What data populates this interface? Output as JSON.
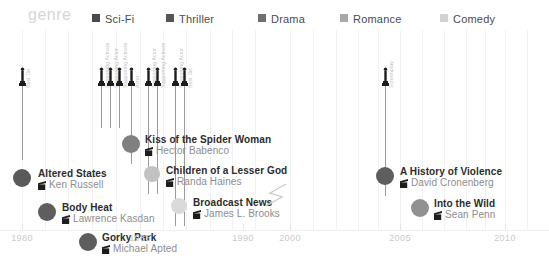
{
  "legend": {
    "title": "genre",
    "items": [
      {
        "label": "Sci-Fi",
        "color": "#4a4a4a",
        "x": 92
      },
      {
        "label": "Thriller",
        "color": "#555555",
        "x": 166
      },
      {
        "label": "Drama",
        "color": "#6e6e6e",
        "x": 258
      },
      {
        "label": "Romance",
        "color": "#a8a8a8",
        "x": 340
      },
      {
        "label": "Comedy",
        "color": "#d2d2d2",
        "x": 440
      }
    ]
  },
  "axis": {
    "ticks": [
      {
        "label": "1980",
        "x": 22
      },
      {
        "label": "1985",
        "x": 140
      },
      {
        "label": "1990",
        "x": 243
      },
      {
        "label": "2000",
        "x": 290
      },
      {
        "label": "2005",
        "x": 400
      },
      {
        "label": "2010",
        "x": 505
      }
    ],
    "break_marker": "axis-break-zigzag"
  },
  "nominations": [
    {
      "category": "Best Dir.",
      "x": 22,
      "top": 36,
      "stem_height": 74,
      "label_y": 58
    },
    {
      "category": "Supporting Actress",
      "x": 101,
      "top": 36,
      "stem_height": 42,
      "label_y": 58
    },
    {
      "category": "Supporting Actor",
      "x": 110,
      "top": 36,
      "stem_height": 42,
      "label_y": 58
    },
    {
      "category": "Supporting Actress",
      "x": 119,
      "top": 36,
      "stem_height": 42,
      "label_y": 58
    },
    {
      "category": "Actor",
      "x": 131,
      "top": 36,
      "stem_height": 78,
      "label_y": 58
    },
    {
      "category": "Supporting Actor",
      "x": 148,
      "top": 36,
      "stem_height": 108,
      "label_y": 58
    },
    {
      "category": "Supporting Actress",
      "x": 157,
      "top": 36,
      "stem_height": 108,
      "label_y": 58
    },
    {
      "category": "Supporting Actor",
      "x": 175,
      "top": 36,
      "stem_height": 140,
      "label_y": 58
    },
    {
      "category": "Best Dir.",
      "x": 184,
      "top": 36,
      "stem_height": 140,
      "label_y": 58
    },
    {
      "category": "Screenplay",
      "x": 385,
      "top": 36,
      "stem_height": 110,
      "label_y": 58
    }
  ],
  "films": [
    {
      "title": "Altered States",
      "director": "Ken Russell",
      "genre": "Sci-Fi",
      "color": "#5a5a5a",
      "dot_x": 22,
      "dot_y": 148,
      "dot_r": 9,
      "has_stem": true,
      "label_x": 38,
      "label_y": 138
    },
    {
      "title": "Body Heat",
      "director": "Lawrence Kasdan",
      "genre": "Thriller",
      "color": "#5e5e5e",
      "dot_x": 47,
      "dot_y": 182,
      "dot_r": 9,
      "has_stem": false,
      "label_x": 62,
      "label_y": 172
    },
    {
      "title": "Gorky Park",
      "director": "Michael Apted",
      "genre": "Thriller",
      "color": "#5e5e5e",
      "dot_x": 88,
      "dot_y": 212,
      "dot_r": 9,
      "has_stem": false,
      "label_x": 102,
      "label_y": 202
    },
    {
      "title": "Kiss of the Spider Woman",
      "director": "Hector Babenco",
      "genre": "Drama",
      "color": "#808080",
      "dot_x": 131,
      "dot_y": 114,
      "dot_r": 9,
      "has_stem": true,
      "label_x": 145,
      "label_y": 104
    },
    {
      "title": "Children of a Lesser God",
      "director": "Randa Haines",
      "genre": "Romance",
      "color": "#c2c2c2",
      "dot_x": 152,
      "dot_y": 144,
      "dot_r": 8,
      "has_stem": true,
      "label_x": 166,
      "label_y": 135
    },
    {
      "title": "Broadcast News",
      "director": "James L. Brooks",
      "genre": "Comedy",
      "color": "#dadada",
      "dot_x": 179,
      "dot_y": 176,
      "dot_r": 8,
      "has_stem": true,
      "label_x": 193,
      "label_y": 167
    },
    {
      "title": "A History of Violence",
      "director": "David Cronenberg",
      "genre": "Thriller",
      "color": "#5e5e5e",
      "dot_x": 385,
      "dot_y": 146,
      "dot_r": 9,
      "has_stem": true,
      "label_x": 400,
      "label_y": 136
    },
    {
      "title": "Into the Wild",
      "director": "Sean Penn",
      "genre": "Drama",
      "color": "#919191",
      "dot_x": 420,
      "dot_y": 178,
      "dot_r": 9,
      "has_stem": false,
      "label_x": 434,
      "label_y": 168
    }
  ],
  "chart_data": {
    "type": "scatter",
    "title": "genre",
    "xlabel": "",
    "ylabel": "",
    "xlim": [
      1979,
      2011
    ],
    "grid": true,
    "legend_position": "top",
    "axis_break": "between 1990 and 2000",
    "x_ticks": [
      "1980",
      "1985",
      "1990",
      "2000",
      "2005",
      "2010"
    ],
    "legend_entries": [
      "Sci-Fi",
      "Thriller",
      "Drama",
      "Romance",
      "Comedy"
    ],
    "series": [
      {
        "name": "films",
        "points": [
          {
            "label": "Altered States",
            "director": "Ken Russell",
            "genre": "Sci-Fi",
            "year": 1980,
            "oscar_nominations": [
              "Best Dir."
            ]
          },
          {
            "label": "Body Heat",
            "director": "Lawrence Kasdan",
            "genre": "Thriller",
            "year": 1981,
            "oscar_nominations": []
          },
          {
            "label": "Gorky Park",
            "director": "Michael Apted",
            "genre": "Thriller",
            "year": 1983,
            "oscar_nominations": []
          },
          {
            "label": "Kiss of the Spider Woman",
            "director": "Hector Babenco",
            "genre": "Drama",
            "year": 1985,
            "oscar_nominations": [
              "Actor"
            ]
          },
          {
            "label": "Children of a Lesser God",
            "director": "Randa Haines",
            "genre": "Romance",
            "year": 1986,
            "oscar_nominations": [
              "Supporting Actor",
              "Supporting Actress"
            ]
          },
          {
            "label": "Broadcast News",
            "director": "James L. Brooks",
            "genre": "Comedy",
            "year": 1987,
            "oscar_nominations": [
              "Supporting Actor",
              "Best Dir."
            ]
          },
          {
            "label": "A History of Violence",
            "director": "David Cronenberg",
            "genre": "Thriller",
            "year": 2005,
            "oscar_nominations": [
              "Screenplay"
            ]
          },
          {
            "label": "Into the Wild",
            "director": "Sean Penn",
            "genre": "Drama",
            "year": 2007,
            "oscar_nominations": []
          }
        ]
      }
    ]
  }
}
